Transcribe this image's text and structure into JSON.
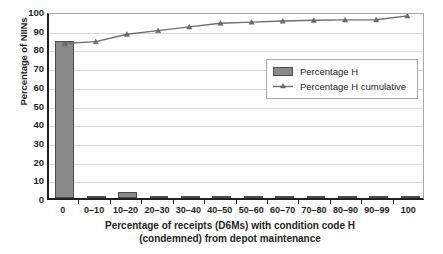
{
  "chart_data": {
    "type": "bar",
    "title": "",
    "subtitle": "",
    "xlabel": "Percentage of receipts (D6Ms) with condition code H (condemned) from depot maintenance",
    "xlabel_line1": "Percentage of receipts (D6Ms) with condition code H",
    "xlabel_line2": "(condemned) from depot maintenance",
    "ylabel": "Percentage of NIINs",
    "ylim": [
      0,
      100
    ],
    "ytick_step": 10,
    "yticks": [
      "100",
      "90",
      "80",
      "70",
      "60",
      "50",
      "40",
      "30",
      "20",
      "10",
      "0"
    ],
    "ytick_values": [
      100,
      90,
      80,
      70,
      60,
      50,
      40,
      30,
      20,
      10,
      0
    ],
    "grid": true,
    "grid_axis": "y",
    "legend_position": "upper-right-inside",
    "categories": [
      "0",
      "0–10",
      "10–20",
      "20–30",
      "30–40",
      "40–50",
      "50–60",
      "60–70",
      "70–80",
      "80–90",
      "90–99",
      "100"
    ],
    "series": [
      {
        "name": "Percentage H",
        "type": "bar",
        "color": "#8a8a8a",
        "edge_color": "#4d4d4d",
        "values": [
          84,
          1,
          3,
          1.3,
          1.2,
          1.3,
          0.4,
          0.4,
          0.3,
          0.2,
          0.2,
          1
        ]
      },
      {
        "name": "Percentage H cumulative",
        "type": "line",
        "color": "#6d6e71",
        "marker": "triangle",
        "values": [
          84,
          85,
          89,
          91,
          93,
          95,
          95.6,
          96.2,
          96.6,
          96.8,
          96.9,
          99
        ]
      }
    ]
  },
  "legend": {
    "entries": [
      {
        "label": "Percentage H",
        "marker": "bar-swatch"
      },
      {
        "label": "Percentage H cumulative",
        "marker": "line-triangle-swatch"
      }
    ]
  },
  "colors": {
    "bar_fill": "#8a8a8a",
    "bar_edge": "#4d4d4d",
    "line": "#6d6e71",
    "gridline": "#d7d8da",
    "axis": "#231f20",
    "plot_border": "#a7a9ac",
    "background": "#ffffff",
    "text": "#231f20"
  }
}
